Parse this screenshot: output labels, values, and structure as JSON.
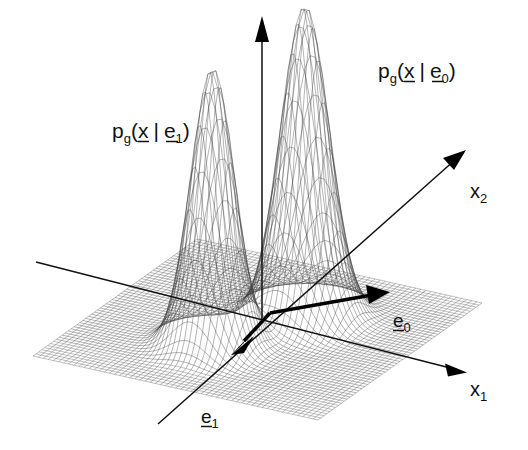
{
  "figure": {
    "background_color": "#ffffff",
    "ink_color": "#111111",
    "mesh_color": "#3a3a3a"
  },
  "labels": {
    "density_class1": {
      "p": "p",
      "sub_p": "g",
      "open": "(",
      "x": "x",
      "bar": "|",
      "e": "e",
      "sub_e": "1",
      "close": ")"
    },
    "density_class0": {
      "p": "p",
      "sub_p": "g",
      "open": "(",
      "x": "x",
      "bar": "|",
      "e": "e",
      "sub_e": "0",
      "close": ")"
    },
    "axis_x1": {
      "base": "x",
      "sub": "1"
    },
    "axis_x2": {
      "base": "x",
      "sub": "2"
    },
    "basis_e0": {
      "base": "e",
      "sub": "0"
    },
    "basis_e1": {
      "base": "e",
      "sub": "1"
    }
  },
  "chart_data": {
    "type": "surface",
    "title": "",
    "xlabel": "x1",
    "ylabel": "x2",
    "zlabel": "p_g(x|e)",
    "grid": true,
    "legend": "none",
    "projection": "3d-wireframe",
    "surface_function": "sum of two bivariate Gaussian bumps on a flat base plane",
    "domain": {
      "u": [
        -1,
        1
      ],
      "v": [
        -1,
        1
      ]
    },
    "mesh_resolution": {
      "u": 56,
      "v": 56
    },
    "peaks": [
      {
        "name": "p_g(x|e_1)",
        "label": "p_g(x | e_1)",
        "center_uv": [
          -0.34,
          0.12
        ],
        "amplitude": 1.0,
        "sigma": 0.135,
        "apex_px": [
          233,
          94
        ]
      },
      {
        "name": "p_g(x|e_0)",
        "label": "p_g(x | e_0)",
        "center_uv": [
          0.3,
          -0.16
        ],
        "amplitude": 1.12,
        "sigma": 0.15,
        "apex_px": [
          380,
          38
        ]
      }
    ],
    "axes": [
      {
        "name": "vertical-density-axis",
        "from_px": [
          262,
          318
        ],
        "to_px": [
          262,
          18
        ],
        "arrow": "up"
      },
      {
        "name": "x1-axis",
        "from_px": [
          36,
          262
        ],
        "to_px": [
          468,
          372
        ],
        "arrow": "end"
      },
      {
        "name": "x2-axis",
        "from_px": [
          158,
          424
        ],
        "to_px": [
          466,
          150
        ],
        "arrow": "end"
      }
    ],
    "basis_vectors": [
      {
        "name": "e_0",
        "from_px": [
          270,
          313
        ],
        "to_px": [
          388,
          292
        ],
        "label": "e_0"
      },
      {
        "name": "e_1",
        "from_px": [
          270,
          313
        ],
        "to_px": [
          237,
          349
        ],
        "label": "e_1"
      }
    ],
    "plane_corners_px": [
      [
        195,
        215
      ],
      [
        482,
        303
      ],
      [
        318,
        420
      ],
      [
        33,
        356
      ]
    ]
  }
}
